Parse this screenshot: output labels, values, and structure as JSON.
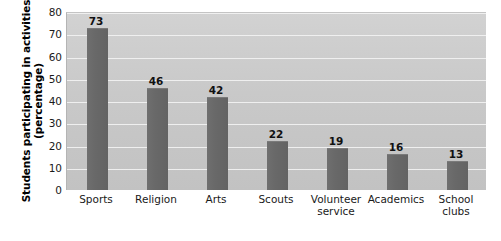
{
  "chart_data": {
    "type": "bar",
    "title": "",
    "xlabel": "",
    "ylabel": "Students participating in activities (percentage)",
    "ylabel_lines": [
      "Students participating in activities",
      "(percentage)"
    ],
    "categories": [
      "Sports",
      "Religion",
      "Arts",
      "Scouts",
      "Volunteer service",
      "Academics",
      "School clubs"
    ],
    "category_lines": [
      [
        "Sports"
      ],
      [
        "Religion"
      ],
      [
        "Arts"
      ],
      [
        "Scouts"
      ],
      [
        "Volunteer",
        "service"
      ],
      [
        "Academics"
      ],
      [
        "School",
        "clubs"
      ]
    ],
    "values": [
      73,
      46,
      42,
      22,
      19,
      16,
      13
    ],
    "value_labels": [
      "73",
      "46",
      "42",
      "22",
      "19",
      "16",
      "13"
    ],
    "ylim": [
      0,
      80
    ],
    "ytick_values": [
      0,
      10,
      20,
      30,
      40,
      50,
      60,
      70,
      80
    ],
    "ytick_labels": [
      "0",
      "10",
      "20",
      "30",
      "40",
      "50",
      "60",
      "70",
      "80"
    ],
    "grid": true,
    "legend": false,
    "colors": {
      "bar": "#696969",
      "plot_background": "#c9c9c9",
      "gridline": "#f2f2f2",
      "text": "#1a1a1a",
      "page_background": "#ffffff"
    }
  }
}
